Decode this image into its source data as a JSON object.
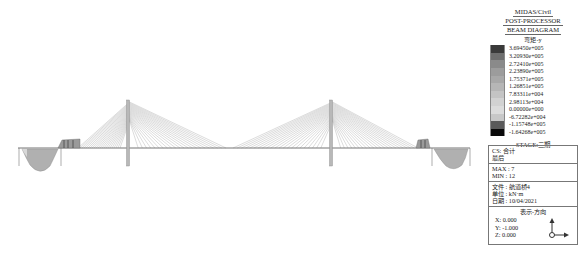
{
  "header": {
    "app": "MIDAS/Civil",
    "module": "POST-PROCESSOR",
    "diagram": "BEAM DIAGRAM",
    "result_type": "弯矩-y"
  },
  "legend": {
    "values": [
      "3.69450e+005",
      "3.20930e+005",
      "2.72410e+005",
      "2.23890e+005",
      "1.75371e+005",
      "1.26851e+005",
      "7.83311e+004",
      "2.98113e+004",
      "0.00000e+000",
      "-6.72282e+004",
      "-1.15748e+005",
      "-1.64268e+005"
    ],
    "colors": [
      "#3a3a3a",
      "#6e6e6e",
      "#8a8a8a",
      "#9c9c9c",
      "#a8a8a8",
      "#b6b6b6",
      "#c4c4c4",
      "#d2d2d2",
      "#dcdcdc",
      "#c8c8c8",
      "#5a5a5a",
      "#0a0a0a"
    ],
    "stage": "STAGE:二期"
  },
  "info": {
    "cs_label": "CS: 合计",
    "cs_sub": "最后",
    "max": "MAX : 7",
    "min": "MIN : 12",
    "file": "文件 : 航道桥4",
    "unit": "单位 : kN·m",
    "date": "日期 : 10/04/2021",
    "view_title": "表示-方向",
    "view_x": "X: 0.000",
    "view_y": "Y: -1.000",
    "view_z": "Z: 0.000"
  },
  "structure": {
    "deck_y": 148,
    "deck_x_start": 18,
    "deck_x_end": 470,
    "towers": [
      {
        "x": 128,
        "top": 100,
        "bottom": 165
      },
      {
        "x": 331,
        "top": 100,
        "bottom": 165
      }
    ]
  }
}
